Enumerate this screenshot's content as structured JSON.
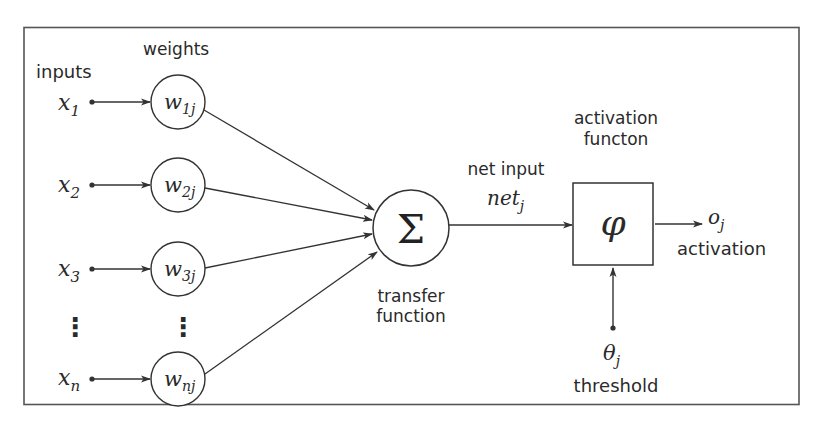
{
  "diagram": {
    "labels": {
      "inputs": "inputs",
      "weights": "weights",
      "transfer_function_line1": "transfer",
      "transfer_function_line2": "function",
      "net_input": "net input",
      "activation_function_line1": "activation",
      "activation_function_line2": "functon",
      "activation": "activation",
      "threshold": "threshold"
    },
    "inputs": [
      {
        "var": "x",
        "sub": "1"
      },
      {
        "var": "x",
        "sub": "2"
      },
      {
        "var": "x",
        "sub": "3"
      },
      {
        "var": "x",
        "sub": "n"
      }
    ],
    "weights": [
      {
        "var": "w",
        "sub": "1j"
      },
      {
        "var": "w",
        "sub": "2j"
      },
      {
        "var": "w",
        "sub": "3j"
      },
      {
        "var": "w",
        "sub": "nj"
      }
    ],
    "ellipsis": "⋮",
    "sum_symbol": "Σ",
    "net": {
      "var": "net",
      "sub": "j"
    },
    "activation_symbol": "φ",
    "output": {
      "var": "o",
      "sub": "j"
    },
    "threshold": {
      "var": "θ",
      "sub": "j"
    },
    "colors": {
      "line": "#333333",
      "text": "#2a2a2a",
      "frame": "#555555",
      "background": "#ffffff"
    }
  }
}
